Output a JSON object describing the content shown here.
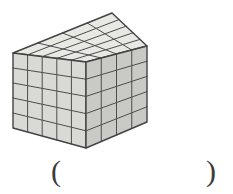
{
  "figure": {
    "type": "cuboid-of-unit-cubes",
    "units": {
      "width": 5,
      "depth": 4,
      "height": 5
    },
    "colors": {
      "top_face": "#e8e8e4",
      "left_face": "#d9d9d5",
      "right_face": "#c9c9c5",
      "grid_line": "#4d4d4d",
      "outline": "#434343",
      "background": "#ffffff"
    }
  },
  "answer_blank": {
    "open_paren": "(",
    "close_paren": ")"
  }
}
